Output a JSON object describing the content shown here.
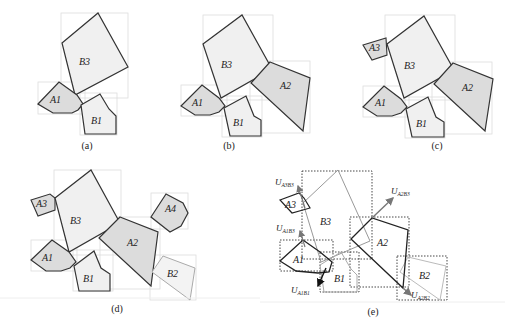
{
  "figure": {
    "panels": [
      {
        "id": "a",
        "caption": "(a)",
        "labels": {
          "B3": "B3",
          "A1": "A1",
          "B1": "B1"
        }
      },
      {
        "id": "b",
        "caption": "(b)",
        "labels": {
          "B3": "B3",
          "A1": "A1",
          "B1": "B1",
          "A2": "A2"
        }
      },
      {
        "id": "c",
        "caption": "(c)",
        "labels": {
          "A3": "A3",
          "B3": "B3",
          "A1": "A1",
          "B1": "B1",
          "A2": "A2"
        }
      },
      {
        "id": "d",
        "caption": "(d)",
        "labels": {
          "A3": "A3",
          "B3": "B3",
          "A1": "A1",
          "B1": "B1",
          "A2": "A2",
          "A4": "A4",
          "B2": "B2"
        }
      },
      {
        "id": "e",
        "caption": "(e)",
        "labels": {
          "A3": "A3",
          "B3": "B3",
          "A1": "A1",
          "B1": "B1",
          "A2": "A2",
          "B2": "B2"
        },
        "vectors": {
          "UA3B3": {
            "main": "U",
            "sub": "A3B3"
          },
          "UA1B3": {
            "main": "U",
            "sub": "A1B3"
          },
          "UA1B1": {
            "main": "U",
            "sub": "A1B1"
          },
          "UA2B3": {
            "main": "U",
            "sub": "A2B3"
          },
          "UA2B2": {
            "main": "U",
            "sub": "A2B2"
          }
        }
      }
    ],
    "colors": {
      "fill_B": "#f0f0f0",
      "fill_A": "#dcdcdc",
      "stroke": "#333333",
      "bbox_light": "#dddddd",
      "bbox_dotted": "#333333",
      "arrow": "#777777"
    }
  }
}
